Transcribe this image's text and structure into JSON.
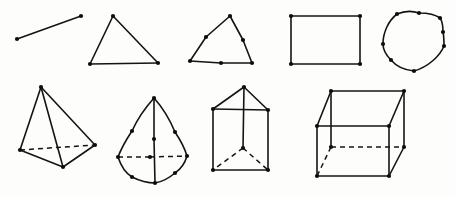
{
  "canvas": {
    "width": 456,
    "height": 197,
    "background_color": "#fdfdfc",
    "ink_color": "#141414",
    "vertex_color": "#0d0d0d",
    "vertex_radius": 2.1,
    "stroke_width": 1.6,
    "dash_pattern": "5 4"
  },
  "figures": [
    {
      "id": "line-segment",
      "name": "line-segment",
      "label": "line segment",
      "row": "top",
      "index": 1,
      "vertices": [
        {
          "name": "end-a",
          "x": 17,
          "y": 39
        },
        {
          "name": "end-b",
          "x": 81,
          "y": 16
        }
      ],
      "solid_edges": [
        [
          0,
          1
        ]
      ],
      "dashed_edges": [],
      "curves": []
    },
    {
      "id": "triangle-plain",
      "name": "triangle-plain",
      "label": "triangle",
      "row": "top",
      "index": 2,
      "vertices": [
        {
          "name": "apex",
          "x": 113,
          "y": 16
        },
        {
          "name": "bottom-left",
          "x": 90,
          "y": 64
        },
        {
          "name": "bottom-right",
          "x": 158,
          "y": 63
        }
      ],
      "solid_edges": [
        [
          0,
          1
        ],
        [
          1,
          2
        ],
        [
          2,
          0
        ]
      ],
      "dashed_edges": [],
      "curves": []
    },
    {
      "id": "triangle-subdivided",
      "name": "triangle-subdivided",
      "label": "triangle with edge midpoints",
      "row": "top",
      "index": 3,
      "vertices": [
        {
          "name": "apex",
          "x": 230,
          "y": 16
        },
        {
          "name": "mid-right-edge",
          "x": 243,
          "y": 40
        },
        {
          "name": "bottom-right",
          "x": 252,
          "y": 63
        },
        {
          "name": "mid-bottom-edge",
          "x": 221,
          "y": 63
        },
        {
          "name": "bottom-left",
          "x": 190,
          "y": 61
        },
        {
          "name": "mid-left-edge",
          "x": 206,
          "y": 37
        }
      ],
      "solid_edges": [
        [
          0,
          1
        ],
        [
          1,
          2
        ],
        [
          2,
          3
        ],
        [
          3,
          4
        ],
        [
          4,
          5
        ],
        [
          5,
          0
        ]
      ],
      "dashed_edges": [],
      "curves": []
    },
    {
      "id": "rectangle",
      "name": "rectangle",
      "label": "rectangle",
      "row": "top",
      "index": 4,
      "vertices": [
        {
          "name": "top-left",
          "x": 291,
          "y": 16
        },
        {
          "name": "top-right",
          "x": 360,
          "y": 16
        },
        {
          "name": "bottom-right",
          "x": 360,
          "y": 64
        },
        {
          "name": "bottom-left",
          "x": 291,
          "y": 64
        }
      ],
      "solid_edges": [
        [
          0,
          1
        ],
        [
          1,
          2
        ],
        [
          2,
          3
        ],
        [
          3,
          0
        ]
      ],
      "dashed_edges": [],
      "curves": []
    },
    {
      "id": "closed-blob",
      "name": "closed-blob-curve",
      "label": "closed curved outline",
      "row": "top",
      "index": 5,
      "vertices": [
        {
          "name": "node-top-left",
          "x": 397,
          "y": 14
        },
        {
          "name": "node-top-mid",
          "x": 419,
          "y": 13
        },
        {
          "name": "node-top-right",
          "x": 440,
          "y": 18
        },
        {
          "name": "node-right-upper",
          "x": 443,
          "y": 32
        },
        {
          "name": "node-right-lower",
          "x": 444,
          "y": 46
        },
        {
          "name": "node-bottom",
          "x": 414,
          "y": 71
        },
        {
          "name": "node-bottom-left",
          "x": 391,
          "y": 60
        },
        {
          "name": "node-left",
          "x": 383,
          "y": 44
        }
      ],
      "solid_edges": [],
      "dashed_edges": [],
      "curves": [
        {
          "name": "blob-outline",
          "path": "M 397 14 C 404 11 413 11 419 13 C 427 13 436 15 440 18 C 443 22 443 27 443 32 C 444 37 444 42 444 46 C 440 56 428 67 414 71 C 404 70 396 66 391 60 C 386 55 383 50 383 44 C 383 33 388 21 397 14 Z"
        }
      ]
    },
    {
      "id": "tetrahedron",
      "name": "tetrahedron",
      "label": "tetrahedron",
      "row": "bottom",
      "index": 1,
      "vertices": [
        {
          "name": "apex",
          "x": 41,
          "y": 87
        },
        {
          "name": "back-left",
          "x": 20,
          "y": 150
        },
        {
          "name": "back-right",
          "x": 95,
          "y": 145
        },
        {
          "name": "front-bottom",
          "x": 63,
          "y": 167
        }
      ],
      "solid_edges": [
        [
          0,
          1
        ],
        [
          0,
          2
        ],
        [
          0,
          3
        ],
        [
          1,
          3
        ],
        [
          3,
          2
        ]
      ],
      "dashed_edges": [
        [
          1,
          2
        ]
      ],
      "curves": []
    },
    {
      "id": "cone-pyramid",
      "name": "cone-pyramid",
      "label": "cone with subdivided base",
      "row": "bottom",
      "index": 2,
      "vertices": [
        {
          "name": "apex",
          "x": 154,
          "y": 98
        },
        {
          "name": "mid-left-edge",
          "x": 132,
          "y": 131
        },
        {
          "name": "mid-right-edge",
          "x": 175,
          "y": 132
        },
        {
          "name": "axis-mid",
          "x": 154,
          "y": 139
        },
        {
          "name": "rim-left",
          "x": 118,
          "y": 157
        },
        {
          "name": "rim-center",
          "x": 150,
          "y": 157
        },
        {
          "name": "rim-right",
          "x": 187,
          "y": 156
        },
        {
          "name": "base-bottom-left",
          "x": 132,
          "y": 177
        },
        {
          "name": "base-bottom",
          "x": 155,
          "y": 183
        },
        {
          "name": "base-bottom-right",
          "x": 175,
          "y": 173
        }
      ],
      "solid_edges": [
        [
          0,
          3
        ],
        [
          3,
          8
        ]
      ],
      "dashed_edges": [
        [
          4,
          5
        ],
        [
          5,
          6
        ]
      ],
      "curves": [
        {
          "name": "left-silhouette",
          "path": "M 154 98 C 145 108 137 120 132 131 C 126 140 121 149 118 157"
        },
        {
          "name": "right-silhouette",
          "path": "M 154 98 C 163 108 170 120 175 132 C 181 141 185 149 187 156"
        },
        {
          "name": "base-left-arc",
          "path": "M 118 157 C 121 166 125 173 132 177 C 140 181 148 183 155 183"
        },
        {
          "name": "base-right-arc",
          "path": "M 187 156 C 185 163 181 169 175 173 C 168 179 161 182 155 183"
        }
      ]
    },
    {
      "id": "triangular-prism-house",
      "name": "triangular-prism",
      "label": "prism with apex and hidden edges",
      "row": "bottom",
      "index": 3,
      "vertices": [
        {
          "name": "apex",
          "x": 244,
          "y": 87
        },
        {
          "name": "top-left",
          "x": 213,
          "y": 109
        },
        {
          "name": "top-right",
          "x": 268,
          "y": 110
        },
        {
          "name": "center-hidden",
          "x": 243,
          "y": 148
        },
        {
          "name": "bottom-left",
          "x": 213,
          "y": 170
        },
        {
          "name": "bottom-right",
          "x": 268,
          "y": 170
        }
      ],
      "solid_edges": [
        [
          0,
          1
        ],
        [
          0,
          2
        ],
        [
          1,
          2
        ],
        [
          0,
          3
        ],
        [
          1,
          4
        ],
        [
          2,
          5
        ],
        [
          4,
          5
        ]
      ],
      "dashed_edges": [
        [
          3,
          4
        ],
        [
          3,
          5
        ]
      ],
      "curves": []
    },
    {
      "id": "cube",
      "name": "cube",
      "label": "cube",
      "row": "bottom",
      "index": 4,
      "vertices": [
        {
          "name": "back-top-left",
          "x": 331,
          "y": 91
        },
        {
          "name": "back-top-right",
          "x": 404,
          "y": 91
        },
        {
          "name": "front-top-left",
          "x": 317,
          "y": 126
        },
        {
          "name": "front-top-right",
          "x": 389,
          "y": 126
        },
        {
          "name": "back-bottom-right",
          "x": 404,
          "y": 147
        },
        {
          "name": "back-bottom-left",
          "x": 331,
          "y": 147
        },
        {
          "name": "front-bottom-left",
          "x": 317,
          "y": 176
        },
        {
          "name": "front-bottom-right",
          "x": 389,
          "y": 176
        }
      ],
      "solid_edges": [
        [
          0,
          1
        ],
        [
          0,
          2
        ],
        [
          1,
          3
        ],
        [
          2,
          3
        ],
        [
          1,
          4
        ],
        [
          3,
          7
        ],
        [
          2,
          6
        ],
        [
          6,
          7
        ],
        [
          4,
          7
        ],
        [
          0,
          5
        ]
      ],
      "dashed_edges": [
        [
          5,
          4
        ],
        [
          5,
          6
        ]
      ],
      "curves": []
    }
  ]
}
